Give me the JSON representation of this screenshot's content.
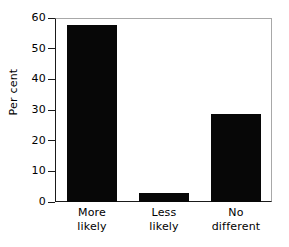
{
  "chart_data": {
    "type": "bar",
    "title": "",
    "xlabel": "",
    "ylabel": "Per cent",
    "categories": [
      "More likely",
      "Less likely",
      "No different"
    ],
    "category_lines": [
      [
        "More",
        "likely"
      ],
      [
        "Less",
        "likely"
      ],
      [
        "No",
        "different"
      ]
    ],
    "values": [
      58,
      3,
      29
    ],
    "ylim": [
      0,
      60
    ],
    "yticks": [
      0,
      10,
      20,
      30,
      40,
      50,
      60
    ],
    "ytick_labels": [
      "0",
      "10",
      "20",
      "30",
      "40",
      "50",
      "60"
    ],
    "grid": false,
    "legend": false,
    "bar_color": "#070707",
    "axis_color": "#1a1a1a",
    "frame_color": "#a8a8a8",
    "background_color": "#ffffff"
  }
}
